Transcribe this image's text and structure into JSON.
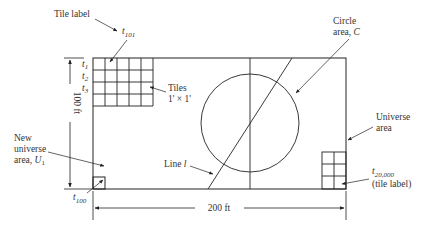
{
  "diagram": {
    "universe": {
      "width_label": "200 ft",
      "height_label": "100 ft"
    },
    "labels": {
      "tile_label": "Tile label",
      "t101_base": "t",
      "t101_sub": "101",
      "t1_base": "t",
      "t1_sub": "1",
      "t2_base": "t",
      "t2_sub": "2",
      "t3_base": "t",
      "t3_sub": "3",
      "tiles_line1": "Tiles",
      "tiles_line2": "1' × 1'",
      "circle_line1": "Circle",
      "circle_line2": "area, ",
      "circle_var": "C",
      "universe_line1": "Universe",
      "universe_line2": "area",
      "new_universe_line1": "New",
      "new_universe_line2": "universe",
      "new_universe_line3": "area, ",
      "new_universe_var": "U",
      "new_universe_sub": "1",
      "line_l_text": "Line ",
      "line_l_var": "l",
      "t20000_base": "t",
      "t20000_sub": "20,000",
      "t20000_note": "(tile label)",
      "t100_base": "t",
      "t100_sub": "100"
    },
    "colors": {
      "line": "#222222",
      "text": "#333333",
      "background": "#ffffff"
    }
  }
}
